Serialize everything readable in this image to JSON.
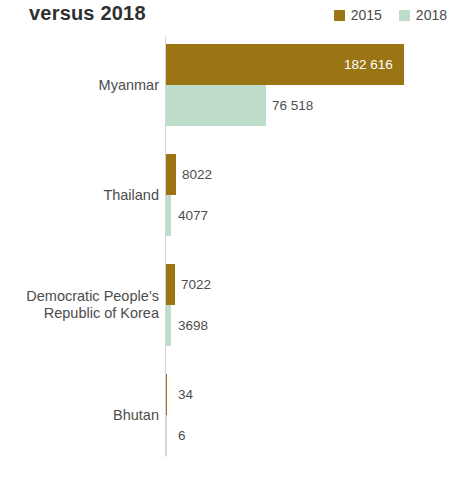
{
  "header": {
    "title": "versus 2018"
  },
  "legend": {
    "position": "top-right",
    "entries": [
      {
        "label": "2015",
        "color": "#9b7413",
        "swatch_name": "legend-swatch-2015"
      },
      {
        "label": "2018",
        "color": "#bddcc9",
        "swatch_name": "legend-swatch-2018"
      }
    ]
  },
  "chart_data": {
    "type": "bar",
    "orientation": "horizontal",
    "title": "versus 2018",
    "xlabel": "",
    "ylabel": "",
    "xlim": [
      0,
      200000
    ],
    "grid": false,
    "legend_position": "top-right",
    "categories": [
      "Myanmar",
      "Thailand",
      "Democratic People’s Republic of Korea",
      "Bhutan"
    ],
    "category_lines": [
      [
        "Myanmar"
      ],
      [
        "Thailand"
      ],
      [
        "Democratic People’s",
        "Republic of Korea"
      ],
      [
        "Bhutan"
      ]
    ],
    "series": [
      {
        "name": "2015",
        "color": "#9b7413",
        "values": [
          182616,
          8022,
          7022,
          34
        ],
        "labels": [
          "182 616",
          "8022",
          "7022",
          "34"
        ]
      },
      {
        "name": "2018",
        "color": "#bddcc9",
        "values": [
          76518,
          4077,
          3698,
          6
        ],
        "labels": [
          "76 518",
          "4077",
          "3698",
          "6"
        ]
      }
    ],
    "xticks": [
      0,
      50000,
      100000,
      150000,
      200000
    ],
    "xticklabels": [
      "0",
      "50 000",
      "100 000",
      "150 000",
      "200 000"
    ]
  }
}
